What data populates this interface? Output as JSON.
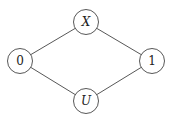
{
  "diagram": {
    "type": "lattice",
    "nodes": [
      {
        "id": "X",
        "label": "X",
        "italic": true,
        "cx": 86,
        "cy": 22,
        "r": 12.5
      },
      {
        "id": "0",
        "label": "0",
        "italic": false,
        "cx": 20,
        "cy": 61,
        "r": 12.5
      },
      {
        "id": "1",
        "label": "1",
        "italic": false,
        "cx": 152,
        "cy": 61,
        "r": 12.5
      },
      {
        "id": "U",
        "label": "U",
        "italic": true,
        "cx": 86,
        "cy": 101,
        "r": 12.5
      }
    ],
    "edges": [
      {
        "from": "0",
        "to": "X"
      },
      {
        "from": "X",
        "to": "1"
      },
      {
        "from": "0",
        "to": "U"
      },
      {
        "from": "U",
        "to": "1"
      }
    ]
  }
}
